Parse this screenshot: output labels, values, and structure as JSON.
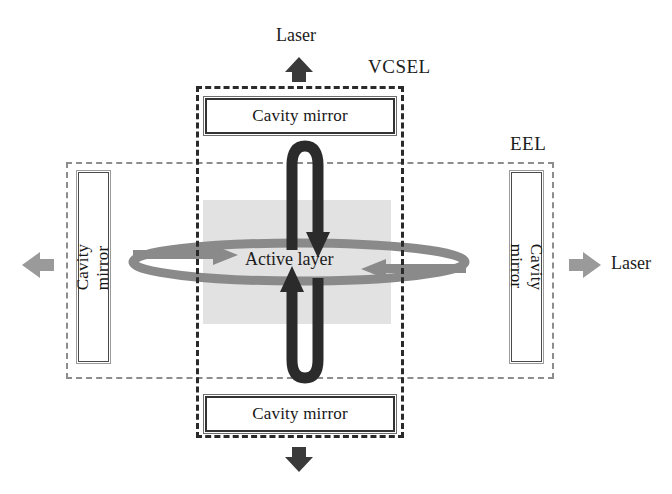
{
  "figure": {
    "type": "schematic-diagram",
    "background_color": "#ffffff"
  },
  "labels": {
    "laser_top": "Laser",
    "laser_right": "Laser",
    "vcsel": "VCSEL",
    "eel": "EEL",
    "active_layer": "Active layer"
  },
  "mirrors": {
    "top": "Cavity mirror",
    "bottom": "Cavity mirror",
    "left": "Cavity mirror",
    "right": "Cavity mirror"
  },
  "devices": [
    {
      "id": "vcsel",
      "label": "VCSEL",
      "orientation": "vertical",
      "outline_style": "dashed",
      "outline_color": "#2a2a2a",
      "mirrors": [
        "top",
        "bottom"
      ],
      "emission": [
        "up",
        "down"
      ]
    },
    {
      "id": "eel",
      "label": "EEL",
      "orientation": "horizontal",
      "outline_style": "dashed",
      "outline_color": "#8d8d8d",
      "mirrors": [
        "left",
        "right"
      ],
      "emission": [
        "left",
        "right"
      ]
    }
  ],
  "arrows": {
    "vertical_cavity_loop_color": "#2b2b2b",
    "horizontal_cavity_loop_color": "#8a8a8a",
    "emission_up": "up-arrow-icon",
    "emission_down": "down-arrow-icon",
    "emission_left": "left-arrow-icon",
    "emission_right": "right-arrow-icon"
  },
  "colors": {
    "active_layer_fill": "#e2e2e2",
    "dark_arrow": "#2b2b2b",
    "gray_arrow": "#8a8a8a",
    "emission_arrow": "#8f8f8f",
    "text": "#1c1c1c"
  }
}
